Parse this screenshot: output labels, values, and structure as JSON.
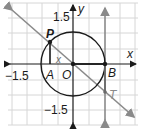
{
  "diagram": {
    "type": "unit-circle-tangent",
    "colors": {
      "grid": "#d6d6d6",
      "axis": "#1a1a1a",
      "circle": "#1a1a1a",
      "line": "#8a8a8a",
      "background": "#ffffff"
    },
    "axes": {
      "x_label": "x",
      "y_label": "y",
      "y_top_tick": "1.5",
      "y_bottom_tick": "−1.5",
      "x_left_tick": "−1.5"
    },
    "points": {
      "P": "P",
      "A": "A",
      "O": "O",
      "B": "B",
      "T": "T"
    },
    "angle_label": "x"
  }
}
